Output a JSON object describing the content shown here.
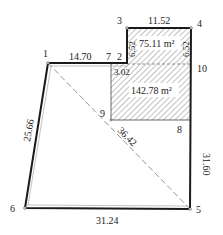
{
  "diagram": {
    "type": "land-parcel-survey",
    "points": [
      {
        "id": "1",
        "label": "1",
        "x": 48,
        "y": 63
      },
      {
        "id": "2",
        "label": "2",
        "x": 127,
        "y": 63
      },
      {
        "id": "3",
        "label": "3",
        "x": 127,
        "y": 28
      },
      {
        "id": "4",
        "label": "4",
        "x": 191,
        "y": 28
      },
      {
        "id": "5",
        "label": "5",
        "x": 190,
        "y": 209
      },
      {
        "id": "6",
        "label": "6",
        "x": 25,
        "y": 208
      },
      {
        "id": "7",
        "label": "7",
        "x": 111,
        "y": 63
      },
      {
        "id": "8",
        "label": "8",
        "x": 191,
        "y": 120
      },
      {
        "id": "9",
        "label": "9",
        "x": 111,
        "y": 120
      },
      {
        "id": "10",
        "label": "10",
        "x": 191,
        "y": 64
      }
    ],
    "edges": [
      {
        "from": "1",
        "to": "7",
        "length": "14.70"
      },
      {
        "from": "3",
        "to": "4",
        "length": "11.52"
      },
      {
        "from": "2",
        "to": "3",
        "length": "6.52"
      },
      {
        "from": "4",
        "to": "10",
        "length": "6.52"
      },
      {
        "from": "4",
        "to": "5",
        "length": "31.60"
      },
      {
        "from": "6",
        "to": "5",
        "length": "31.24"
      },
      {
        "from": "1",
        "to": "6",
        "length": "25.66"
      },
      {
        "from": "1",
        "to": "5",
        "length": "36.42",
        "style": "dashed"
      },
      {
        "from": "7",
        "to": "9",
        "length": "3.02"
      }
    ],
    "areas": [
      {
        "id": "upper",
        "label": "75.11 m²"
      },
      {
        "id": "lower",
        "label": "142.78 m²"
      }
    ],
    "labels": {
      "p1": "1",
      "p2": "2",
      "p3": "3",
      "p4": "4",
      "p5": "5",
      "p6": "6",
      "p7": "7",
      "p8": "8",
      "p9": "9",
      "p10": "10",
      "len_1_7": "14.70",
      "len_3_4": "11.52",
      "len_2_3": "6.52",
      "len_4_10": "6.52",
      "len_4_5": "31.60",
      "len_6_5": "31.24",
      "len_1_6": "25.66",
      "len_1_5": "36.42",
      "len_7_9": "3.02",
      "area_upper": "75.11 m²",
      "area_lower": "142.78 m²"
    },
    "colors": {
      "line": "#1a1a1a",
      "hatch": "#555555",
      "dashed": "#888888"
    }
  }
}
